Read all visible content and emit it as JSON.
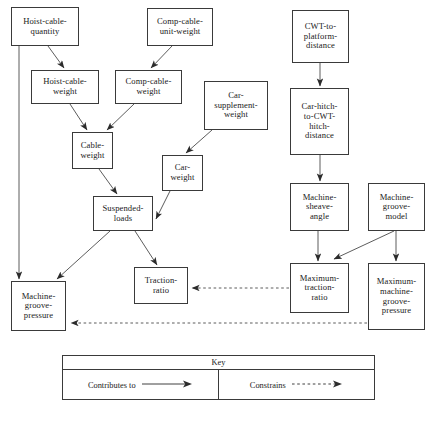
{
  "diagram": {
    "nodes": [
      {
        "id": "hoist-cable-quantity",
        "label": "Hoist-cable-\nquantity",
        "x": 11,
        "y": 7,
        "w": 68,
        "h": 39
      },
      {
        "id": "comp-cable-unit-weight",
        "label": "Comp-cable-\nunit-weight",
        "x": 147,
        "y": 8,
        "w": 66,
        "h": 38
      },
      {
        "id": "cwt-to-platform-distance",
        "label": "CWT-to-\nplatform-\ndistance",
        "x": 292,
        "y": 10,
        "w": 57,
        "h": 53
      },
      {
        "id": "hoist-cable-weight",
        "label": "Hoist-cable-\nweight",
        "x": 31,
        "y": 70,
        "w": 68,
        "h": 34
      },
      {
        "id": "comp-cable-weight",
        "label": "Comp-cable-\nweight",
        "x": 115,
        "y": 70,
        "w": 67,
        "h": 34
      },
      {
        "id": "car-supplement-weight",
        "label": "Car-\nsupplement-\nweight",
        "x": 204,
        "y": 81,
        "w": 64,
        "h": 49
      },
      {
        "id": "car-hitch-to-cwt-hitch-distance",
        "label": "Car-hitch-\nto-CWT-\nhitch-\ndistance",
        "x": 290,
        "y": 88,
        "w": 59,
        "h": 67
      },
      {
        "id": "cable-weight",
        "label": "Cable-\nweight",
        "x": 72,
        "y": 132,
        "w": 41,
        "h": 37
      },
      {
        "id": "car-weight",
        "label": "Car-\nweight",
        "x": 162,
        "y": 155,
        "w": 41,
        "h": 36
      },
      {
        "id": "machine-sheave-angle",
        "label": "Machine-\nsheave-\nangle",
        "x": 290,
        "y": 183,
        "w": 59,
        "h": 48
      },
      {
        "id": "machine-groove-model",
        "label": "Machine-\ngroove-\nmodel",
        "x": 368,
        "y": 183,
        "w": 57,
        "h": 48
      },
      {
        "id": "suspended-loads",
        "label": "Suspended-\nloads",
        "x": 93,
        "y": 196,
        "w": 60,
        "h": 35
      },
      {
        "id": "traction-ratio",
        "label": "Traction-\nratio",
        "x": 134,
        "y": 267,
        "w": 54,
        "h": 37
      },
      {
        "id": "maximum-traction-ratio",
        "label": "Maximum-\ntraction-\nratio",
        "x": 290,
        "y": 263,
        "w": 59,
        "h": 50
      },
      {
        "id": "machine-groove-pressure",
        "label": "Machine-\ngroove-\npressure",
        "x": 11,
        "y": 281,
        "w": 55,
        "h": 50
      },
      {
        "id": "maximum-machine-groove-pressure",
        "label": "Maximum-\nmachine-\ngroove-\npressure",
        "x": 368,
        "y": 263,
        "w": 57,
        "h": 67
      }
    ],
    "edges": [
      {
        "id": "e1",
        "from": "hoist-cable-quantity",
        "to": "hoist-cable-weight",
        "type": "contributes-to"
      },
      {
        "id": "e2",
        "from": "comp-cable-unit-weight",
        "to": "comp-cable-weight",
        "type": "contributes-to"
      },
      {
        "id": "e3",
        "from": "hoist-cable-weight",
        "to": "cable-weight",
        "type": "contributes-to"
      },
      {
        "id": "e4",
        "from": "comp-cable-weight",
        "to": "cable-weight",
        "type": "contributes-to"
      },
      {
        "id": "e5",
        "from": "cable-weight",
        "to": "suspended-loads",
        "type": "contributes-to"
      },
      {
        "id": "e6",
        "from": "car-supplement-weight",
        "to": "car-weight",
        "type": "contributes-to"
      },
      {
        "id": "e7",
        "from": "car-weight",
        "to": "suspended-loads",
        "type": "contributes-to"
      },
      {
        "id": "e8",
        "from": "suspended-loads",
        "to": "machine-groove-pressure",
        "type": "contributes-to"
      },
      {
        "id": "e9",
        "from": "suspended-loads",
        "to": "traction-ratio",
        "type": "contributes-to"
      },
      {
        "id": "e10",
        "from": "hoist-cable-quantity",
        "to": "machine-groove-pressure",
        "type": "contributes-to"
      },
      {
        "id": "e11",
        "from": "cwt-to-platform-distance",
        "to": "car-hitch-to-cwt-hitch-distance",
        "type": "contributes-to"
      },
      {
        "id": "e12",
        "from": "car-hitch-to-cwt-hitch-distance",
        "to": "machine-sheave-angle",
        "type": "contributes-to"
      },
      {
        "id": "e13",
        "from": "machine-sheave-angle",
        "to": "maximum-traction-ratio",
        "type": "contributes-to"
      },
      {
        "id": "e14",
        "from": "machine-groove-model",
        "to": "maximum-traction-ratio",
        "type": "contributes-to"
      },
      {
        "id": "e15",
        "from": "machine-groove-model",
        "to": "maximum-machine-groove-pressure",
        "type": "contributes-to"
      },
      {
        "id": "e16",
        "from": "maximum-traction-ratio",
        "to": "traction-ratio",
        "type": "constrains"
      },
      {
        "id": "e17",
        "from": "maximum-machine-groove-pressure",
        "to": "machine-groove-pressure",
        "type": "constrains"
      }
    ]
  },
  "key": {
    "title": "Key",
    "entries": [
      {
        "id": "contributes-to",
        "label": "Contributes to",
        "line": "solid"
      },
      {
        "id": "constrains",
        "label": "Constrains",
        "line": "dashed"
      }
    ]
  },
  "colors": {
    "stroke": "#3a3a3a",
    "text": "#1a1a1a",
    "background": "#ffffff"
  }
}
